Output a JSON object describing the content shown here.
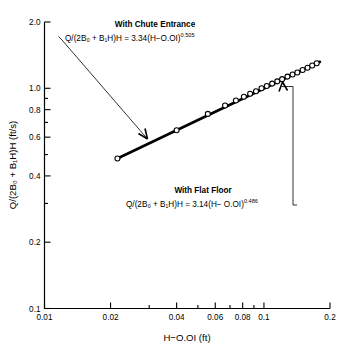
{
  "chart_data": {
    "type": "scatter",
    "title": "",
    "xlabel": "H−O.OI (ft)",
    "ylabel": "Q/(2B₀ + B₁H)H  (ft/s)",
    "xscale": "log",
    "yscale": "log",
    "xlim": [
      0.01,
      0.2
    ],
    "ylim": [
      0.1,
      2.0
    ],
    "grid": false,
    "legend_position": "none",
    "xticks": [
      {
        "value": 0.01,
        "label": "0.01",
        "major": true
      },
      {
        "value": 0.02,
        "label": "0.02",
        "major": true
      },
      {
        "value": 0.03,
        "label": "",
        "major": false
      },
      {
        "value": 0.04,
        "label": "0.04",
        "major": true
      },
      {
        "value": 0.05,
        "label": "",
        "major": false
      },
      {
        "value": 0.06,
        "label": "0.06",
        "major": true
      },
      {
        "value": 0.07,
        "label": "",
        "major": false
      },
      {
        "value": 0.08,
        "label": "0.08",
        "major": true
      },
      {
        "value": 0.09,
        "label": "",
        "major": false
      },
      {
        "value": 0.1,
        "label": "0.1",
        "major": true
      },
      {
        "value": 0.2,
        "label": "0.2",
        "major": true
      }
    ],
    "yticks": [
      {
        "value": 0.1,
        "label": "0.1",
        "major": true
      },
      {
        "value": 0.2,
        "label": "0.2",
        "major": true
      },
      {
        "value": 0.3,
        "label": "",
        "major": false
      },
      {
        "value": 0.4,
        "label": "0.4",
        "major": true
      },
      {
        "value": 0.5,
        "label": "",
        "major": false
      },
      {
        "value": 0.6,
        "label": "0.6",
        "major": true
      },
      {
        "value": 0.7,
        "label": "",
        "major": false
      },
      {
        "value": 0.8,
        "label": "0.8",
        "major": true
      },
      {
        "value": 0.9,
        "label": "",
        "major": false
      },
      {
        "value": 1.0,
        "label": "1.0",
        "major": true
      },
      {
        "value": 2.0,
        "label": "2.0",
        "major": true
      }
    ],
    "series": [
      {
        "name": "measured data",
        "marker": "open-circle",
        "x": [
          0.0215,
          0.04,
          0.0555,
          0.0665,
          0.0745,
          0.081,
          0.0865,
          0.092,
          0.0975,
          0.103,
          0.109,
          0.115,
          0.121,
          0.128,
          0.135,
          0.142,
          0.15,
          0.158,
          0.166,
          0.174
        ],
        "y": [
          0.48,
          0.645,
          0.765,
          0.835,
          0.88,
          0.915,
          0.945,
          0.97,
          1.0,
          1.025,
          1.05,
          1.075,
          1.1,
          1.13,
          1.155,
          1.18,
          1.21,
          1.24,
          1.27,
          1.3
        ]
      }
    ],
    "fit_line": {
      "name": "power-law fit",
      "x_start": 0.0215,
      "x_end": 0.18,
      "y_start": 0.48,
      "y_end": 1.32
    },
    "annotations": [
      {
        "id": "chute-entrance",
        "title": "With Chute Entrance",
        "equation": "Q/(2B₀ + B₁H)H = 3.34(H−O.OI)",
        "exponent": "0.505",
        "leader": "from text to curve"
      },
      {
        "id": "flat-floor",
        "title": "With Flat Floor",
        "equation": "Q/(2B₀ + B₁H)H = 3.14(H− O.OI)",
        "exponent": "0.486",
        "leader": "from text to curve"
      }
    ]
  }
}
